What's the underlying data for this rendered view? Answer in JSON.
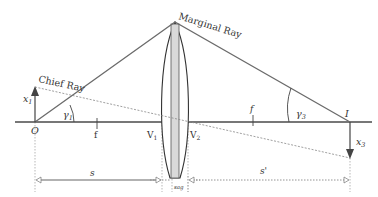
{
  "diagram": {
    "labels": {
      "marginal_ray": "Marginal Ray",
      "chief_ray": "Chief Ray",
      "object_height": "x",
      "object_height_sub": "1",
      "image_height": "x",
      "image_height_sub": "3",
      "object_point": "O",
      "image_point": "I",
      "gamma1": "γ",
      "gamma1_sub": "1",
      "gamma3": "γ",
      "gamma3_sub": "3",
      "focal_front": "f",
      "focal_back": "f",
      "vertex1": "V",
      "vertex1_sub": "1",
      "vertex2": "V",
      "vertex2_sub": "2",
      "object_distance": "s",
      "image_distance": "s'",
      "sag": "sag"
    },
    "colors": {
      "axis": "#4a4a4a",
      "ray": "#6b6b6b",
      "lens_fill": "#d9d9d9",
      "lens_outline": "#333333",
      "dashed": "#888888",
      "text": "#333333"
    }
  }
}
